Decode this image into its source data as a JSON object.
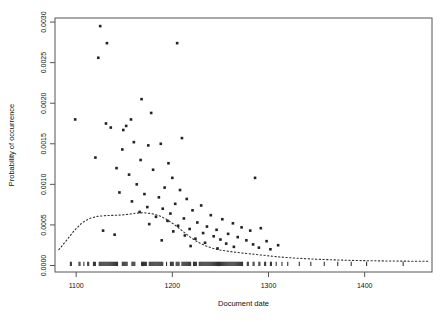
{
  "chart_data": {
    "type": "scatter",
    "title": "",
    "xlabel": "Document date",
    "ylabel": "Probability of occurrence",
    "xlim": [
      1078,
      1470
    ],
    "ylim": [
      -8e-05,
      0.00305
    ],
    "xticks": [
      1100,
      1200,
      1300,
      1400
    ],
    "xtick_labels": [
      "1100",
      "1200",
      "1300",
      "1400"
    ],
    "yticks": [
      0.0,
      0.0005,
      0.001,
      0.0015,
      0.002,
      0.0025,
      0.003
    ],
    "ytick_labels": [
      "0.0000",
      "0.0005",
      "0.0010",
      "0.0015",
      "0.0020",
      "0.0025",
      "0.0030"
    ],
    "grid": false,
    "legend": null,
    "point_color": "#222222",
    "curve_color": "#333333",
    "frame_color": "#555555",
    "series": [
      {
        "name": "Probability of occurrence",
        "marker": "point",
        "points": [
          [
            1125,
            0.00295
          ],
          [
            1132,
            0.00274
          ],
          [
            1123,
            0.00256
          ],
          [
            1205,
            0.00274
          ],
          [
            1168,
            0.00205
          ],
          [
            1157,
            0.0018
          ],
          [
            1178,
            0.00188
          ],
          [
            1099,
            0.0018
          ],
          [
            1152,
            0.00172
          ],
          [
            1149,
            0.00167
          ],
          [
            1210,
            0.00157
          ],
          [
            1148,
            0.00143
          ],
          [
            1131,
            0.00175
          ],
          [
            1136,
            0.0017
          ],
          [
            1160,
            0.00152
          ],
          [
            1175,
            0.00148
          ],
          [
            1188,
            0.0015
          ],
          [
            1120,
            0.00133
          ],
          [
            1167,
            0.0013
          ],
          [
            1196,
            0.00126
          ],
          [
            1142,
            0.0012
          ],
          [
            1180,
            0.00118
          ],
          [
            1155,
            0.00112
          ],
          [
            1200,
            0.00108
          ],
          [
            1286,
            0.00108
          ],
          [
            1163,
            0.001
          ],
          [
            1192,
            0.00096
          ],
          [
            1208,
            0.00093
          ],
          [
            1145,
            0.0009
          ],
          [
            1171,
            0.00088
          ],
          [
            1186,
            0.00084
          ],
          [
            1215,
            0.00082
          ],
          [
            1158,
            0.00079
          ],
          [
            1203,
            0.00076
          ],
          [
            1230,
            0.00074
          ],
          [
            1174,
            0.00072
          ],
          [
            1190,
            0.0007
          ],
          [
            1221,
            0.00068
          ],
          [
            1166,
            0.00066
          ],
          [
            1198,
            0.00064
          ],
          [
            1240,
            0.00062
          ],
          [
            1183,
            0.0006
          ],
          [
            1212,
            0.00058
          ],
          [
            1252,
            0.00057
          ],
          [
            1195,
            0.00055
          ],
          [
            1226,
            0.00053
          ],
          [
            1263,
            0.00052
          ],
          [
            1176,
            0.00051
          ],
          [
            1206,
            0.00049
          ],
          [
            1236,
            0.00048
          ],
          [
            1272,
            0.00047
          ],
          [
            1218,
            0.00045
          ],
          [
            1246,
            0.00044
          ],
          [
            1281,
            0.00043
          ],
          [
            1201,
            0.00042
          ],
          [
            1232,
            0.0004
          ],
          [
            1258,
            0.00039
          ],
          [
            1292,
            0.00046
          ],
          [
            1213,
            0.00037
          ],
          [
            1243,
            0.00036
          ],
          [
            1268,
            0.00035
          ],
          [
            1224,
            0.00033
          ],
          [
            1250,
            0.00032
          ],
          [
            1277,
            0.00031
          ],
          [
            1298,
            0.0003
          ],
          [
            1234,
            0.00028
          ],
          [
            1256,
            0.00027
          ],
          [
            1284,
            0.00026
          ],
          [
            1310,
            0.00025
          ],
          [
            1264,
            0.00023
          ],
          [
            1290,
            0.00022
          ],
          [
            1128,
            0.00043
          ],
          [
            1140,
            0.00038
          ],
          [
            1219,
            0.00024
          ],
          [
            1247,
            0.00021
          ],
          [
            1302,
            0.0002
          ],
          [
            1189,
            0.00031
          ]
        ]
      }
    ],
    "density_curve": {
      "name": "smoothed density",
      "style": "dotted",
      "x": [
        1082,
        1090,
        1098,
        1106,
        1114,
        1122,
        1130,
        1138,
        1146,
        1154,
        1162,
        1170,
        1178,
        1186,
        1194,
        1202,
        1210,
        1218,
        1226,
        1234,
        1242,
        1250,
        1258,
        1266,
        1274,
        1282,
        1290,
        1298,
        1306,
        1314,
        1322,
        1330,
        1340,
        1355,
        1370,
        1390,
        1410,
        1430,
        1450,
        1468
      ],
      "y": [
        0.000195,
        0.00031,
        0.00043,
        0.000525,
        0.00058,
        0.000605,
        0.000615,
        0.000618,
        0.000622,
        0.00063,
        0.000645,
        0.00065,
        0.00064,
        0.000615,
        0.00057,
        0.000505,
        0.00043,
        0.000355,
        0.000292,
        0.000245,
        0.000212,
        0.00019,
        0.000175,
        0.000163,
        0.000152,
        0.000142,
        0.000132,
        0.000122,
        0.000112,
        0.000103,
        9.6e-05,
        9e-05,
        8.3e-05,
        7.5e-05,
        6.9e-05,
        6.2e-05,
        5.8e-05,
        5.5e-05,
        5.3e-05,
        5.2e-05
      ]
    },
    "rug": {
      "name": "document date rug",
      "y": 2e-05,
      "x": [
        1094,
        1095,
        1103,
        1104,
        1108,
        1112,
        1113,
        1118,
        1119,
        1120,
        1124,
        1125,
        1126,
        1127,
        1128,
        1129,
        1130,
        1131,
        1132,
        1133,
        1134,
        1135,
        1136,
        1137,
        1138,
        1139,
        1140,
        1141,
        1142,
        1143,
        1148,
        1149,
        1150,
        1151,
        1152,
        1153,
        1158,
        1159,
        1160,
        1161,
        1168,
        1169,
        1170,
        1171,
        1172,
        1173,
        1176,
        1177,
        1178,
        1179,
        1180,
        1181,
        1182,
        1183,
        1184,
        1185,
        1186,
        1187,
        1188,
        1189,
        1190,
        1194,
        1198,
        1199,
        1200,
        1201,
        1204,
        1205,
        1206,
        1207,
        1210,
        1211,
        1212,
        1213,
        1214,
        1215,
        1216,
        1217,
        1218,
        1219,
        1222,
        1223,
        1224,
        1225,
        1228,
        1229,
        1230,
        1231,
        1232,
        1233,
        1234,
        1235,
        1236,
        1237,
        1238,
        1239,
        1240,
        1241,
        1242,
        1243,
        1244,
        1245,
        1246,
        1247,
        1248,
        1249,
        1250,
        1251,
        1252,
        1253,
        1254,
        1255,
        1256,
        1257,
        1258,
        1259,
        1260,
        1261,
        1262,
        1263,
        1264,
        1265,
        1266,
        1267,
        1268,
        1269,
        1270,
        1271,
        1272,
        1273,
        1278,
        1279,
        1284,
        1285,
        1290,
        1291,
        1296,
        1297,
        1302,
        1303,
        1308,
        1314,
        1320,
        1332,
        1344,
        1358,
        1372,
        1386,
        1402,
        1440
      ]
    }
  },
  "layout": {
    "plot_left": 55,
    "plot_right": 432,
    "plot_top": 18,
    "plot_bottom": 272
  }
}
